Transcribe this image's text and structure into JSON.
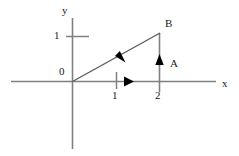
{
  "figure": {
    "type": "vector-diagram",
    "background_color": "#ffffff",
    "axis_color": "#808080",
    "vector_color": "#404040",
    "marker_color": "#000000",
    "text_color": "#1a1a1a",
    "axes": {
      "x_axis_label": "x",
      "y_axis_label": "y",
      "origin_label": "0",
      "x_ticks": [
        {
          "label": "1",
          "value": 1
        },
        {
          "label": "2",
          "value": 2
        }
      ],
      "y_ticks": [
        {
          "label": "1",
          "value": 1
        }
      ]
    },
    "vectors": [
      {
        "name": "A",
        "label": "A",
        "description": "vertical vector at x = 2 pointing up",
        "start": [
          2,
          0
        ],
        "end": [
          2,
          1
        ],
        "arrow": "up"
      },
      {
        "name": "B",
        "label": "B",
        "description": "diagonal resultant vector from origin to point (2, 1)",
        "start": [
          0,
          0
        ],
        "end": [
          2,
          1
        ],
        "arrow": "diagonal-midpoint"
      },
      {
        "name": "x-component",
        "label": "",
        "description": "horizontal component along x-axis from origin to x = 2",
        "start": [
          0,
          0
        ],
        "end": [
          2,
          0
        ],
        "arrow": "right"
      }
    ],
    "point_labels": [
      {
        "label": "B",
        "at": [
          2,
          1
        ]
      },
      {
        "label": "A",
        "at": [
          2,
          0.55
        ]
      }
    ]
  }
}
